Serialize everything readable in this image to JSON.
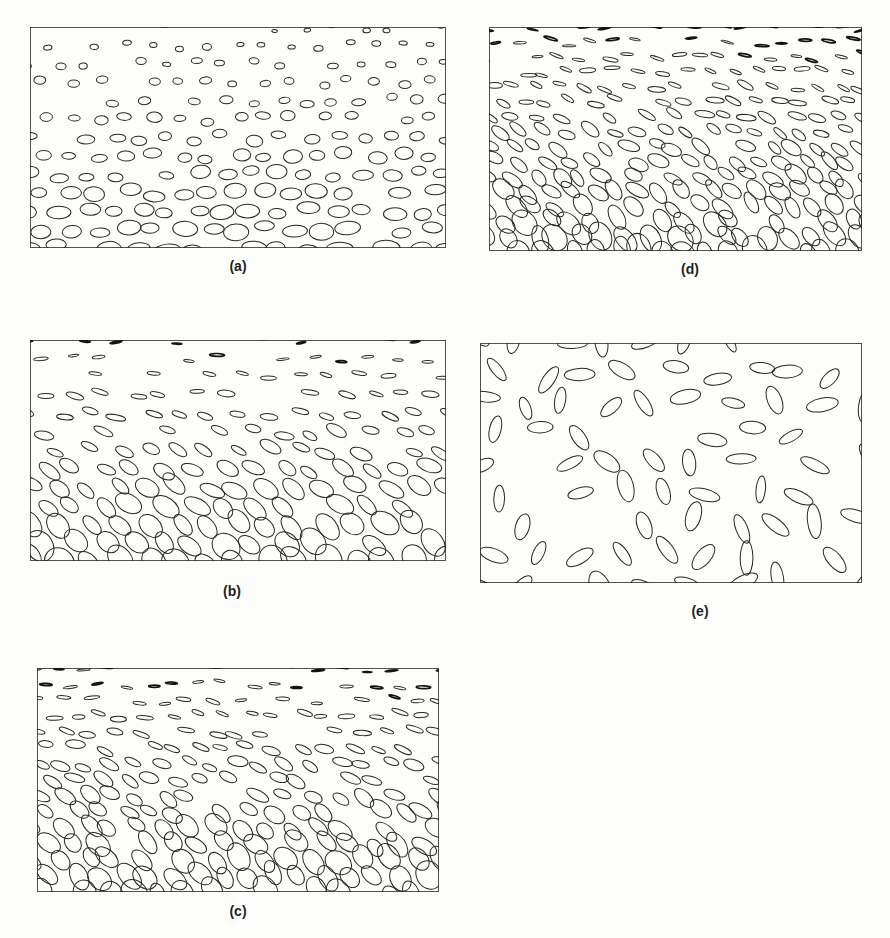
{
  "figure": {
    "width": 890,
    "height": 938,
    "background_color": "#fdfdfc",
    "ink_color": "#2a2724",
    "frame_color": "#555049",
    "label_color": "#231f1c"
  },
  "panels": [
    {
      "id": "panel-a",
      "label": "(a)",
      "frame": {
        "x": 30,
        "y": 27,
        "width": 416,
        "height": 221
      },
      "label_pos": {
        "x": 196,
        "y": 258,
        "width": 84
      },
      "field": {
        "type": "ellipse-field",
        "orientation_mode": "horizontal",
        "base_angle_deg": 0,
        "angle_jitter_deg": 6,
        "angle_gradient_deg": 0,
        "size_gradient": "increasing-downward",
        "minor_over_major_top": 0.62,
        "minor_over_major_bottom": 0.58,
        "major_top_px": 6.5,
        "major_bottom_px": 23,
        "columns": 16,
        "rows": 13,
        "row_stagger_px": 13,
        "jitter_x_px": 5,
        "jitter_y_px": 4,
        "heavy_fraction": 0.0,
        "seed": 101
      }
    },
    {
      "id": "panel-b",
      "label": "(b)",
      "frame": {
        "x": 30,
        "y": 340,
        "width": 416,
        "height": 221
      },
      "label_pos": {
        "x": 190,
        "y": 583,
        "width": 84
      },
      "field": {
        "type": "ellipse-field",
        "orientation_mode": "tilting",
        "base_angle_deg": 0,
        "angle_jitter_deg": 12,
        "angle_gradient_deg": 52,
        "size_gradient": "increasing-downward",
        "minor_over_major_top": 0.14,
        "minor_over_major_bottom": 0.72,
        "major_top_px": 11,
        "major_bottom_px": 29,
        "columns": 15,
        "rows": 13,
        "row_stagger_px": 14,
        "jitter_x_px": 6,
        "jitter_y_px": 4,
        "heavy_fraction": 0.22,
        "seed": 202
      }
    },
    {
      "id": "panel-c",
      "label": "(c)",
      "frame": {
        "x": 37,
        "y": 668,
        "width": 402,
        "height": 224
      },
      "label_pos": {
        "x": 196,
        "y": 903,
        "width": 84
      },
      "field": {
        "type": "ellipse-field",
        "orientation_mode": "tilting",
        "base_angle_deg": 0,
        "angle_jitter_deg": 14,
        "angle_gradient_deg": 58,
        "size_gradient": "increasing-downward",
        "minor_over_major_top": 0.12,
        "minor_over_major_bottom": 0.74,
        "major_top_px": 11,
        "major_bottom_px": 27,
        "columns": 17,
        "rows": 15,
        "row_stagger_px": 12,
        "jitter_x_px": 6,
        "jitter_y_px": 4,
        "heavy_fraction": 0.3,
        "seed": 303
      }
    },
    {
      "id": "panel-d",
      "label": "(d)",
      "frame": {
        "x": 489,
        "y": 27,
        "width": 373,
        "height": 224
      },
      "label_pos": {
        "x": 648,
        "y": 261,
        "width": 84
      },
      "field": {
        "type": "ellipse-field",
        "orientation_mode": "tilting",
        "base_angle_deg": 0,
        "angle_jitter_deg": 16,
        "angle_gradient_deg": 62,
        "size_gradient": "increasing-downward",
        "minor_over_major_top": 0.11,
        "minor_over_major_bottom": 0.7,
        "major_top_px": 11,
        "major_bottom_px": 26,
        "columns": 17,
        "rows": 16,
        "row_stagger_px": 11,
        "jitter_x_px": 6,
        "jitter_y_px": 4,
        "heavy_fraction": 0.34,
        "seed": 404
      }
    },
    {
      "id": "panel-e",
      "label": "(e)",
      "frame": {
        "x": 480,
        "y": 343,
        "width": 382,
        "height": 240
      },
      "label_pos": {
        "x": 658,
        "y": 603,
        "width": 84
      },
      "field": {
        "type": "ellipse-field",
        "orientation_mode": "random",
        "base_angle_deg": 0,
        "angle_jitter_deg": 90,
        "angle_gradient_deg": 0,
        "size_gradient": "uniform",
        "minor_over_major_top": 0.38,
        "minor_over_major_bottom": 0.46,
        "major_top_px": 26,
        "major_bottom_px": 30,
        "columns": 10,
        "rows": 9,
        "row_stagger_px": 19,
        "jitter_x_px": 9,
        "jitter_y_px": 7,
        "heavy_fraction": 0.0,
        "seed": 505
      }
    }
  ]
}
